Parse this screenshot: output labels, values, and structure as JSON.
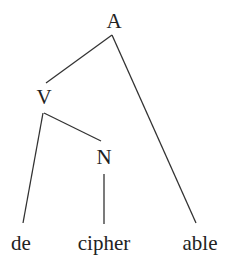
{
  "tree": {
    "nodes": {
      "A": {
        "label": "A"
      },
      "V": {
        "label": "V"
      },
      "N": {
        "label": "N"
      },
      "de": {
        "label": "de"
      },
      "cipher": {
        "label": "cipher"
      },
      "able": {
        "label": "able"
      }
    },
    "edges": [
      [
        "A",
        "V"
      ],
      [
        "A",
        "able"
      ],
      [
        "V",
        "de"
      ],
      [
        "V",
        "N"
      ],
      [
        "N",
        "cipher"
      ]
    ]
  },
  "colors": {
    "line": "#333333",
    "text": "#222222"
  }
}
